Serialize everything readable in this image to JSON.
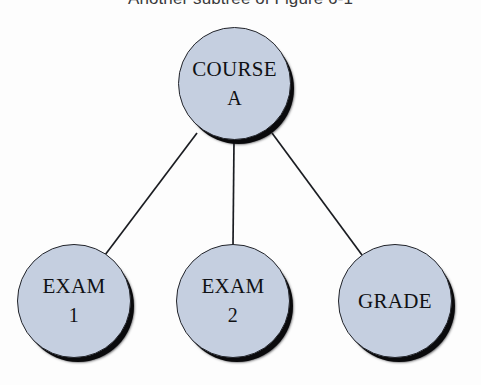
{
  "figure": {
    "caption": "Another subtree of Figure 6-1",
    "type": "tree-diagram",
    "background_color": "#fdfdfd",
    "node_fill_color": "#c5cfe0",
    "node_border_color": "#22242a",
    "node_shadow_color": "#0a0a0c",
    "edge_color": "#1b1d22",
    "text_color": "#101114",
    "caption_color": "#3a3a3c"
  },
  "nodes": {
    "root": {
      "name": "root-node",
      "line1": "COURSE",
      "line2": "A",
      "center_x": 234,
      "center_y": 84,
      "diameter": 113
    },
    "exam1": {
      "name": "exam-1-node",
      "line1": "EXAM",
      "line2": "1",
      "center_x": 74,
      "center_y": 301,
      "diameter": 114
    },
    "exam2": {
      "name": "exam-2-node",
      "line1": "EXAM",
      "line2": "2",
      "center_x": 233,
      "center_y": 301,
      "diameter": 114
    },
    "grade": {
      "name": "grade-node",
      "line1": "GRADE",
      "line2": "",
      "center_x": 395,
      "center_y": 301,
      "diameter": 114
    }
  },
  "edges": [
    {
      "from": "COURSE A",
      "to": "EXAM 1",
      "x1": 197,
      "y1": 133,
      "x2": 105,
      "y2": 255
    },
    {
      "from": "COURSE A",
      "to": "EXAM 2",
      "x1": 234,
      "y1": 141,
      "x2": 233,
      "y2": 245
    },
    {
      "from": "COURSE A",
      "to": "GRADE",
      "x1": 272,
      "y1": 133,
      "x2": 362,
      "y2": 255
    }
  ]
}
